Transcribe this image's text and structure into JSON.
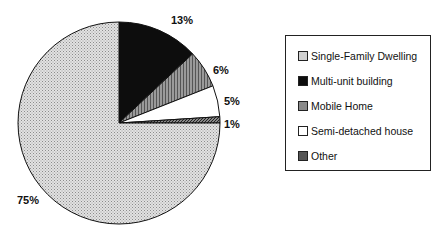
{
  "chart_data": {
    "type": "pie",
    "title": "",
    "categories": [
      "Single-Family Dwelling",
      "Multi-unit building",
      "Mobile Home",
      "Semi-detached house",
      "Other"
    ],
    "values": [
      75,
      13,
      6,
      5,
      1
    ],
    "labels": [
      "75%",
      "13%",
      "6%",
      "5%",
      "1%"
    ],
    "legend_position": "right",
    "fills": [
      "#d6d6d6",
      "#0d0d0d",
      "#8a8a8a",
      "#ffffff",
      "#5a5a5a"
    ]
  },
  "legend": {
    "items": [
      {
        "label": "Single-Family Dwelling"
      },
      {
        "label": "Multi-unit building"
      },
      {
        "label": "Mobile Home"
      },
      {
        "label": "Semi-detached house"
      },
      {
        "label": "Other"
      }
    ]
  }
}
